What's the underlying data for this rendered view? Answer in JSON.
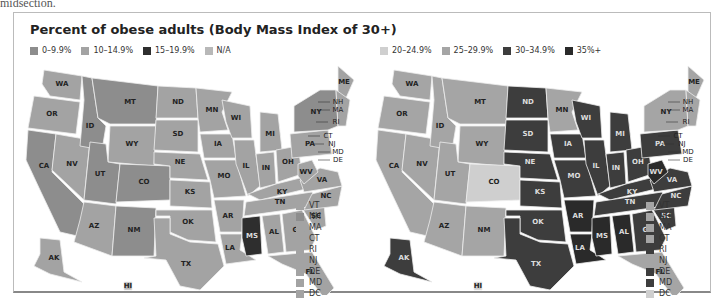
{
  "intro_fragment": "midsection.",
  "title": "Percent of obese adults (Body Mass Index of 30+)",
  "colors": {
    "c0": "#8d8d8d",
    "c10": "#a3a3a3",
    "c15": "#2e2e2e",
    "na": "#b8b8b8",
    "c20": "#cfcfcf",
    "c25": "#a5a5a5",
    "c30": "#3d3d3d",
    "c35": "#2a2a2a"
  },
  "legend_left": [
    {
      "label": "0–9.9%",
      "key": "c0"
    },
    {
      "label": "10–14.9%",
      "key": "c10"
    },
    {
      "label": "15–19.9%",
      "key": "c15"
    },
    {
      "label": "N/A",
      "key": "na"
    }
  ],
  "legend_right": [
    {
      "label": "20–24.9%",
      "key": "c20"
    },
    {
      "label": "25–29.9%",
      "key": "c25"
    },
    {
      "label": "30–34.9%",
      "key": "c30"
    },
    {
      "label": "35%+",
      "key": "c35"
    }
  ],
  "northeast_left": [
    {
      "state": "VT",
      "key": "c10"
    },
    {
      "state": "NH",
      "key": "c0"
    },
    {
      "state": "MA",
      "key": "c10"
    },
    {
      "state": "CT",
      "key": "c10"
    },
    {
      "state": "RI",
      "key": "c10"
    },
    {
      "state": "NJ",
      "key": "c10"
    },
    {
      "state": "DE",
      "key": "c10"
    },
    {
      "state": "MD",
      "key": "c10"
    },
    {
      "state": "DC",
      "key": "c10"
    }
  ],
  "northeast_right": [
    {
      "state": "VT",
      "key": "c25"
    },
    {
      "state": "NH",
      "key": "c25"
    },
    {
      "state": "MA",
      "key": "c25"
    },
    {
      "state": "CT",
      "key": "c25"
    },
    {
      "state": "RI",
      "key": "c30"
    },
    {
      "state": "NJ",
      "key": "c25"
    },
    {
      "state": "DE",
      "key": "c30"
    },
    {
      "state": "MD",
      "key": "c30"
    },
    {
      "state": "DC",
      "key": "c20"
    }
  ],
  "chart_data": [
    {
      "type": "choropleth",
      "title": "Percent of obese adults (Body Mass Index of 30+) — earlier period",
      "legend": [
        "0–9.9%",
        "10–14.9%",
        "15–19.9%",
        "N/A"
      ],
      "states": {
        "WA": "10–14.9%",
        "OR": "10–14.9%",
        "CA": "0–9.9%",
        "NV": "10–14.9%",
        "ID": "0–9.9%",
        "MT": "0–9.9%",
        "WY": "10–14.9%",
        "UT": "0–9.9%",
        "CO": "0–9.9%",
        "AZ": "10–14.9%",
        "NM": "0–9.9%",
        "ND": "10–14.9%",
        "SD": "10–14.9%",
        "NE": "10–14.9%",
        "KS": "10–14.9%",
        "OK": "10–14.9%",
        "TX": "10–14.9%",
        "MN": "10–14.9%",
        "IA": "10–14.9%",
        "MO": "10–14.9%",
        "AR": "10–14.9%",
        "LA": "10–14.9%",
        "WI": "10–14.9%",
        "IL": "10–14.9%",
        "MI": "10–14.9%",
        "IN": "10–14.9%",
        "OH": "10–14.9%",
        "KY": "10–14.9%",
        "TN": "10–14.9%",
        "MS": "15–19.9%",
        "AL": "10–14.9%",
        "GA": "10–14.9%",
        "FL": "10–14.9%",
        "SC": "10–14.9%",
        "NC": "10–14.9%",
        "VA": "10–14.9%",
        "WV": "10–14.9%",
        "PA": "10–14.9%",
        "NY": "0–9.9%",
        "ME": "10–14.9%",
        "AK": "10–14.9%",
        "HI": "N/A",
        "VT": "10–14.9%",
        "NH": "0–9.9%",
        "MA": "10–14.9%",
        "CT": "10–14.9%",
        "RI": "10–14.9%",
        "NJ": "10–14.9%",
        "DE": "10–14.9%",
        "MD": "10–14.9%",
        "DC": "10–14.9%"
      }
    },
    {
      "type": "choropleth",
      "title": "Percent of obese adults (Body Mass Index of 30+) — later period",
      "legend": [
        "20–24.9%",
        "25–29.9%",
        "30–34.9%",
        "35%+"
      ],
      "states": {
        "WA": "25–29.9%",
        "OR": "25–29.9%",
        "CA": "25–29.9%",
        "NV": "25–29.9%",
        "ID": "25–29.9%",
        "MT": "25–29.9%",
        "WY": "25–29.9%",
        "UT": "25–29.9%",
        "CO": "20–24.9%",
        "AZ": "25–29.9%",
        "NM": "25–29.9%",
        "ND": "30–34.9%",
        "SD": "30–34.9%",
        "NE": "30–34.9%",
        "KS": "30–34.9%",
        "OK": "30–34.9%",
        "TX": "30–34.9%",
        "MN": "25–29.9%",
        "IA": "30–34.9%",
        "MO": "30–34.9%",
        "AR": "35%+",
        "LA": "35%+",
        "WI": "30–34.9%",
        "IL": "30–34.9%",
        "MI": "30–34.9%",
        "IN": "30–34.9%",
        "OH": "30–34.9%",
        "KY": "30–34.9%",
        "TN": "30–34.9%",
        "MS": "35%+",
        "AL": "35%+",
        "GA": "30–34.9%",
        "FL": "25–29.9%",
        "SC": "30–34.9%",
        "NC": "30–34.9%",
        "VA": "30–34.9%",
        "WV": "35%+",
        "PA": "30–34.9%",
        "NY": "25–29.9%",
        "ME": "25–29.9%",
        "AK": "30–34.9%",
        "HI": "20–24.9%",
        "VT": "25–29.9%",
        "NH": "25–29.9%",
        "MA": "25–29.9%",
        "CT": "25–29.9%",
        "RI": "30–34.9%",
        "NJ": "25–29.9%",
        "DE": "30–34.9%",
        "MD": "30–34.9%",
        "DC": "20–24.9%"
      }
    }
  ],
  "map_left": {
    "WA": "c10",
    "OR": "c10",
    "CA": "c0",
    "NV": "c10",
    "ID": "c0",
    "MT": "c0",
    "WY": "c10",
    "UT": "c0",
    "CO": "c0",
    "AZ": "c10",
    "NM": "c0",
    "ND": "c10",
    "SD": "c10",
    "NE": "c10",
    "KS": "c10",
    "OK": "c10",
    "TX": "c10",
    "MN": "c10",
    "IA": "c10",
    "MO": "c10",
    "AR": "c10",
    "LA": "c10",
    "WI": "c10",
    "IL": "c10",
    "MI": "c10",
    "IN": "c10",
    "OH": "c10",
    "KY": "c10",
    "TN": "c10",
    "MS": "c15",
    "AL": "c10",
    "GA": "c10",
    "FL": "c10",
    "SC": "c10",
    "NC": "c10",
    "VA": "c10",
    "WV": "c10",
    "PA": "c10",
    "NY": "c0",
    "ME": "c10",
    "NE_small": "c10",
    "AK": "c10",
    "HI": "na"
  },
  "map_right": {
    "WA": "c25",
    "OR": "c25",
    "CA": "c25",
    "NV": "c25",
    "ID": "c25",
    "MT": "c25",
    "WY": "c25",
    "UT": "c25",
    "CO": "c20",
    "AZ": "c25",
    "NM": "c25",
    "ND": "c30",
    "SD": "c30",
    "NE": "c30",
    "KS": "c30",
    "OK": "c30",
    "TX": "c30",
    "MN": "c25",
    "IA": "c30",
    "MO": "c30",
    "AR": "c35",
    "LA": "c35",
    "WI": "c30",
    "IL": "c30",
    "MI": "c30",
    "IN": "c30",
    "OH": "c30",
    "KY": "c30",
    "TN": "c30",
    "MS": "c35",
    "AL": "c35",
    "GA": "c30",
    "FL": "c25",
    "SC": "c30",
    "NC": "c30",
    "VA": "c30",
    "WV": "c35",
    "PA": "c30",
    "NY": "c25",
    "ME": "c25",
    "NE_small": "c25",
    "AK": "c30",
    "HI": "c20"
  }
}
